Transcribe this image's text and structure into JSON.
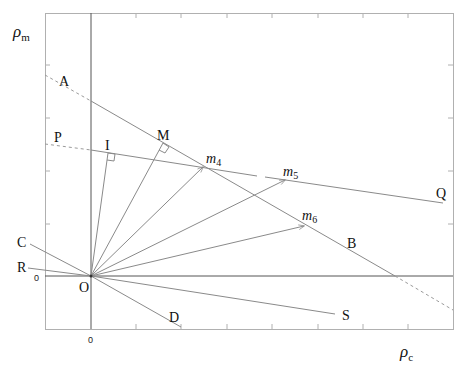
{
  "diagram": {
    "axes": {
      "x_label": "ρ",
      "x_sub": "c",
      "y_label": "ρ",
      "y_sub": "m",
      "x_origin_tick": "0",
      "y_origin_tick": "0"
    },
    "points": {
      "A": "A",
      "B": "B",
      "P": "P",
      "Q": "Q",
      "C": "C",
      "D": "D",
      "R": "R",
      "S": "S",
      "O": "O",
      "I": "I",
      "M": "M",
      "m4": "m",
      "m4_sub": "4",
      "m5": "m",
      "m5_sub": "5",
      "m6": "m",
      "m6_sub": "6"
    },
    "colors": {
      "line": "#8a8a8a",
      "axis": "#555555",
      "frame": "#b0b0b0",
      "text": "#111111"
    }
  }
}
